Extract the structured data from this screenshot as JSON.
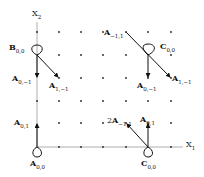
{
  "axes": {
    "x_label": "X",
    "x_sub": "1",
    "y_label": "X",
    "y_sub": "2"
  },
  "grid": {
    "cols_x": [
      37,
      59,
      81,
      103,
      126,
      148,
      171
    ],
    "rows_y": [
      32,
      55,
      78,
      101,
      123
    ]
  },
  "labels": {
    "B00": {
      "main": "B",
      "sub": "0,0"
    },
    "A0m1_left": {
      "main": "A",
      "sub": "0,−1"
    },
    "A1m1_left": {
      "main": "A",
      "sub": "1,−1"
    },
    "Am11_top": {
      "main": "A",
      "sub": "−1,1"
    },
    "C00_top": {
      "main": "C",
      "sub": "0,0"
    },
    "A0m1_right": {
      "main": "A",
      "sub": "0,−1"
    },
    "A1m1_right": {
      "main": "A",
      "sub": "1,−1"
    },
    "A01_left": {
      "main": "A",
      "sub": "0,1"
    },
    "A00_bottom": {
      "main": "A",
      "sub": "0,0"
    },
    "2Am11": {
      "prefix": "2",
      "main": "A",
      "sub": "−1,1"
    },
    "A01_right": {
      "main": "A",
      "sub": "0,1"
    },
    "C00_bottom": {
      "main": "C",
      "sub": "0,0"
    }
  }
}
